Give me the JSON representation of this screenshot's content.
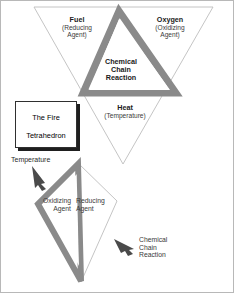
{
  "figure": {
    "title": "The Fire Tetrahedron",
    "legend_label_line1": "The Fire",
    "legend_label_line2": "Tetrahedron"
  },
  "colors": {
    "gray_fill": "#8a8a8a",
    "gray_edge_light": "#9a9a9a",
    "outline": "#b5b5b5",
    "text": "#2b2b2b",
    "background": "#ffffff",
    "border": "#b8b8b8"
  },
  "tetrahedron": {
    "faces": [
      {
        "id": "fuel",
        "name": "Fuel",
        "qualifier_line1": "(Reducing",
        "qualifier_line2": "Agent)"
      },
      {
        "id": "oxygen",
        "name": "Oxygen",
        "qualifier_line1": "(Oxidizing",
        "qualifier_line2": "Agent)"
      },
      {
        "id": "heat",
        "name": "Heat",
        "qualifier_line1": "(Temperature)",
        "qualifier_line2": ""
      },
      {
        "id": "chemical-chain-reaction",
        "name_line1": "Chemical",
        "name_line2": "Chain",
        "name_line3": "Reaction"
      }
    ]
  },
  "exploded_view": {
    "annotations": [
      {
        "id": "temperature",
        "label": "Temperature",
        "arrow": "down-right"
      },
      {
        "id": "oxidizing-agent",
        "label_line1": "Oxidizing",
        "label_line2": "Agent"
      },
      {
        "id": "reducing-agent",
        "label_line1": "Reducing",
        "label_line2": "Agent"
      },
      {
        "id": "chemical-chain-reaction",
        "label_line1": "Chemical",
        "label_line2": "Chain",
        "label_line3": "Reaction",
        "arrow": "up-left"
      }
    ]
  }
}
